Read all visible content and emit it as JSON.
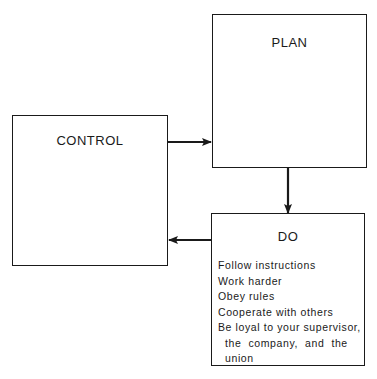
{
  "diagram": {
    "type": "flow-cycle",
    "nodes": [
      {
        "id": "plan",
        "label": "PLAN"
      },
      {
        "id": "control",
        "label": "CONTROL"
      },
      {
        "id": "do",
        "label": "DO",
        "items": [
          "Follow instructions",
          "Work harder",
          "Obey rules",
          "Cooperate with others",
          "Be loyal to your supervisor,",
          "  the  company,  and  the",
          "  union"
        ]
      }
    ],
    "edges": [
      {
        "from": "control",
        "to": "plan"
      },
      {
        "from": "plan",
        "to": "do"
      },
      {
        "from": "do",
        "to": "control"
      }
    ],
    "colors": {
      "stroke": "#1a1a1a",
      "background": "#ffffff"
    }
  }
}
